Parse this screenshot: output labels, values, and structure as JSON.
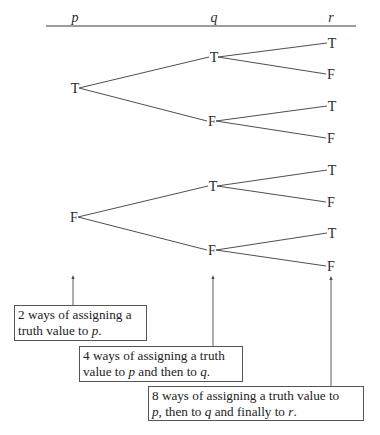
{
  "header": {
    "columns": [
      {
        "label": "p",
        "x": 75
      },
      {
        "label": "q",
        "x": 214
      },
      {
        "label": "r",
        "x": 331
      }
    ],
    "rule": {
      "x1": 46,
      "x2": 356,
      "y": 26
    }
  },
  "tree": {
    "nodes": [
      {
        "id": "p-T",
        "label": "T",
        "x": 75,
        "y": 88
      },
      {
        "id": "p-F",
        "label": "F",
        "x": 74,
        "y": 217
      },
      {
        "id": "pT-qT",
        "label": "T",
        "x": 214,
        "y": 57
      },
      {
        "id": "pT-qF",
        "label": "F",
        "x": 212,
        "y": 121
      },
      {
        "id": "pF-qT",
        "label": "T",
        "x": 213,
        "y": 186
      },
      {
        "id": "pF-qF",
        "label": "F",
        "x": 212,
        "y": 250
      },
      {
        "id": "TT-rT",
        "label": "T",
        "x": 332,
        "y": 43
      },
      {
        "id": "TT-rF",
        "label": "F",
        "x": 331,
        "y": 74
      },
      {
        "id": "TF-rT",
        "label": "T",
        "x": 332,
        "y": 106
      },
      {
        "id": "TF-rF",
        "label": "F",
        "x": 331,
        "y": 138
      },
      {
        "id": "FT-rT",
        "label": "T",
        "x": 332,
        "y": 170
      },
      {
        "id": "FT-rF",
        "label": "F",
        "x": 331,
        "y": 202
      },
      {
        "id": "FF-rT",
        "label": "T",
        "x": 332,
        "y": 233
      },
      {
        "id": "FF-rF",
        "label": "F",
        "x": 331,
        "y": 266
      }
    ],
    "edges": [
      [
        "p-T",
        "pT-qT"
      ],
      [
        "p-T",
        "pT-qF"
      ],
      [
        "p-F",
        "pF-qT"
      ],
      [
        "p-F",
        "pF-qF"
      ],
      [
        "pT-qT",
        "TT-rT"
      ],
      [
        "pT-qT",
        "TT-rF"
      ],
      [
        "pT-qF",
        "TF-rT"
      ],
      [
        "pT-qF",
        "TF-rF"
      ],
      [
        "pF-qT",
        "FT-rT"
      ],
      [
        "pF-qT",
        "FT-rF"
      ],
      [
        "pF-qF",
        "FF-rT"
      ],
      [
        "pF-qF",
        "FF-rF"
      ]
    ]
  },
  "annotations": [
    {
      "line1": "2 ways of assigning a",
      "line2_pre": "truth value to ",
      "line2_var1": "p",
      "line2_mid": ".",
      "line2_var2": "",
      "line2_post": "",
      "line2_var3": "",
      "line2_end": "",
      "box": {
        "x": 14,
        "y": 305,
        "w": 133,
        "h": 36
      },
      "arrow": {
        "x": 73,
        "y1": 275,
        "y2": 305
      }
    },
    {
      "line1": "4 ways of assigning a truth",
      "line2_pre": "value to ",
      "line2_var1": "p",
      "line2_mid": " and then to ",
      "line2_var2": "q",
      "line2_post": ".",
      "line2_var3": "",
      "line2_end": "",
      "box": {
        "x": 79,
        "y": 346,
        "w": 164,
        "h": 36
      },
      "arrow": {
        "x": 213,
        "y1": 275,
        "y2": 346
      }
    },
    {
      "line1": "8 ways of assigning a truth value to",
      "line2_pre": "",
      "line2_var1": "p",
      "line2_mid": ", then to ",
      "line2_var2": "q",
      "line2_post": " and finally to ",
      "line2_var3": "r",
      "line2_end": ".",
      "box": {
        "x": 148,
        "y": 386,
        "w": 216,
        "h": 35
      },
      "arrow": {
        "x": 331,
        "y1": 276,
        "y2": 386
      }
    }
  ]
}
